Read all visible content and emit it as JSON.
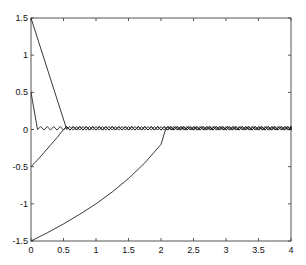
{
  "chart_data": {
    "type": "line",
    "title": "",
    "xlabel": "",
    "ylabel": "",
    "xlim": [
      0,
      4
    ],
    "ylim": [
      -1.5,
      1.5
    ],
    "grid": false,
    "legend": null,
    "x_ticks": [
      "0",
      "0.5",
      "1",
      "1.5",
      "2",
      "2.5",
      "3",
      "3.5",
      "4"
    ],
    "y_ticks": [
      "-1.5",
      "-1",
      "-0.5",
      "0",
      "0.5",
      "1",
      "1.5"
    ],
    "line_color": "#222222",
    "chattering": {
      "period": 0.1,
      "amplitude": 0.04,
      "description": "sliding-mode chattering around 0 after each trajectory reaches the surface"
    },
    "series": [
      {
        "name": "x0=1.5",
        "x": [
          0,
          0.55
        ],
        "y": [
          1.5,
          0
        ],
        "reach_time": 0.55
      },
      {
        "name": "x0=0.5",
        "x": [
          0,
          0.1
        ],
        "y": [
          0.5,
          0
        ],
        "reach_time": 0.1
      },
      {
        "name": "x0=-0.5",
        "x": [
          0,
          0.1,
          0.2,
          0.3,
          0.4,
          0.5
        ],
        "y": [
          -0.5,
          -0.41,
          -0.31,
          -0.21,
          -0.11,
          0
        ],
        "reach_time": 0.5
      },
      {
        "name": "x0=-1.5",
        "x": [
          0,
          0.25,
          0.5,
          0.75,
          1.0,
          1.25,
          1.5,
          1.75,
          2.0,
          2.07
        ],
        "y": [
          -1.5,
          -1.39,
          -1.27,
          -1.14,
          -1.0,
          -0.84,
          -0.66,
          -0.45,
          -0.2,
          0
        ],
        "reach_time": 2.07
      }
    ]
  }
}
